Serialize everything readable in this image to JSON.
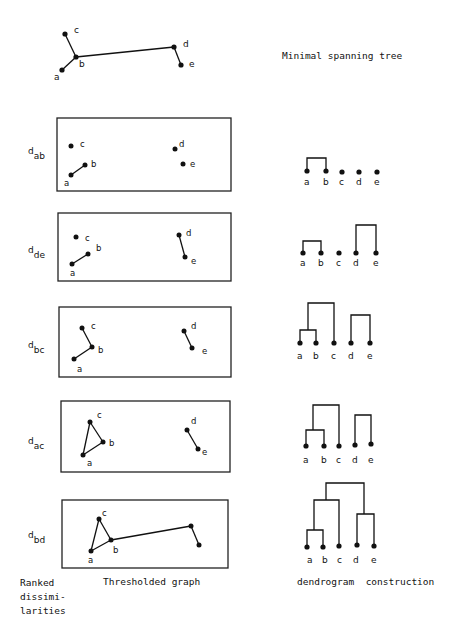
{
  "mst": {
    "title": "Minimal spanning tree",
    "nodes": [
      {
        "id": "a",
        "x": 62,
        "y": 70
      },
      {
        "id": "b",
        "x": 76,
        "y": 57
      },
      {
        "id": "c",
        "x": 65,
        "y": 34
      },
      {
        "id": "d",
        "x": 174,
        "y": 47
      },
      {
        "id": "e",
        "x": 181,
        "y": 65
      }
    ],
    "edges": [
      [
        "a",
        "b"
      ],
      [
        "b",
        "c"
      ],
      [
        "b",
        "d"
      ],
      [
        "d",
        "e"
      ]
    ]
  },
  "rows": [
    {
      "label": "d",
      "sub": "ab"
    },
    {
      "label": "d",
      "sub": "de"
    },
    {
      "label": "d",
      "sub": "bc"
    },
    {
      "label": "d",
      "sub": "ac"
    },
    {
      "label": "d",
      "sub": "bd"
    }
  ],
  "footer": {
    "col1_lines": [
      "Ranked",
      "dissimi-",
      "larities"
    ],
    "col2": "Thresholded graph",
    "col3": "dendrogram  construction"
  },
  "leaf_labels": [
    "a",
    "b",
    "c",
    "d",
    "e"
  ]
}
